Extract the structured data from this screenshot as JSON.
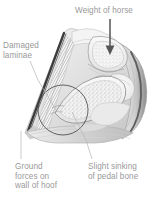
{
  "figure": {
    "type": "anatomical-cross-section",
    "background_color": "#ffffff",
    "text_color": "#9a9a9a",
    "line_color": "#b0b0b0",
    "arrow_color": "#555555",
    "outline_color": "#3a3a3a"
  },
  "labels": {
    "weight": "Weight of horse",
    "laminae": "Damaged\nlaminae",
    "ground": "Ground\nforces on\nwall of hoof",
    "pedal": "Slight sinking\nof pedal bone"
  },
  "annotations": {
    "arrow": "down-arrow",
    "circle": "circle-highlight-damaged-laminae",
    "leaders": [
      "leader-laminae",
      "leader-ground",
      "leader-pedal"
    ]
  }
}
